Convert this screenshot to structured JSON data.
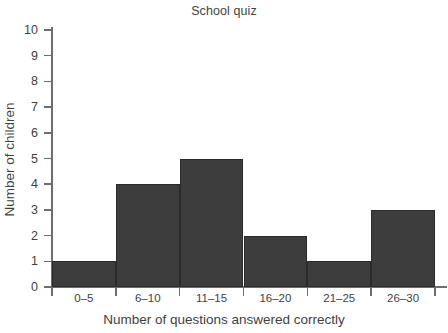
{
  "chart_data": {
    "type": "bar",
    "title": "School quiz",
    "xlabel": "Number of questions answered correctly",
    "ylabel": "Number of children",
    "categories": [
      "0–5",
      "6–10",
      "11–15",
      "16–20",
      "21–25",
      "26–30"
    ],
    "values": [
      1,
      4,
      5,
      2,
      1,
      3
    ],
    "ylim": [
      0,
      10
    ],
    "ytick_labels": [
      "0",
      "1",
      "2",
      "3",
      "4",
      "5",
      "6",
      "7",
      "8",
      "9",
      "10"
    ],
    "ytick_values": [
      0,
      1,
      2,
      3,
      4,
      5,
      6,
      7,
      8,
      9,
      10
    ],
    "grid": false,
    "legend": null,
    "bar_color": "#3d3d3d",
    "bar_edge_color": "#2b2b2b",
    "axis_color": "#6d6d6d",
    "text_color": "#3f3f3f",
    "background": "#ffffff",
    "style": "histogram-contiguous-bars"
  }
}
